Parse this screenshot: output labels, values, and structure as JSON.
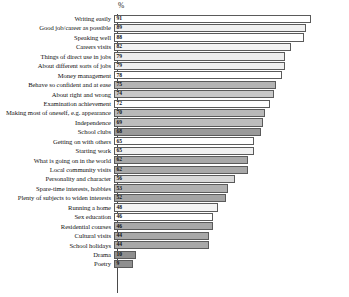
{
  "chart": {
    "axis_header": "%",
    "value_suffix": ""
  },
  "chart_data": {
    "type": "bar",
    "orientation": "horizontal",
    "title": "",
    "subtitle": "",
    "xlabel": "%",
    "ylabel": "",
    "xlim": [
      0,
      100
    ],
    "grid": false,
    "legend": "none",
    "categories": [
      "Writing easily",
      "Good job/career as possible",
      "Speaking well",
      "Careers visits",
      "Things of direct use in jobs",
      "About different sorts of jobs",
      "Money management",
      "Behave so confident and at ease",
      "About right and wrong",
      "Examination achievement",
      "Making most of oneself, e.g. appearance",
      "Independence",
      "School clubs",
      "Getting on with others",
      "Starting work",
      "What is going on in the world",
      "Local community visits",
      "Personality and character",
      "Spare-time interests, hobbies",
      "Plenty of subjects to widen interests",
      "Running a home",
      "Sex education",
      "Residential courses",
      "Cultural visits",
      "School holidays",
      "Drama",
      "Poetry"
    ],
    "values": [
      91,
      89,
      88,
      82,
      79,
      79,
      78,
      75,
      74,
      72,
      70,
      69,
      68,
      65,
      65,
      62,
      62,
      56,
      53,
      52,
      48,
      46,
      46,
      44,
      44,
      10,
      9
    ],
    "bar_colors": [
      "#ffffff",
      "#f0f0f0",
      "#ffffff",
      "#f2f2f2",
      "#ededed",
      "#efefef",
      "#ffffff",
      "#b4b4b4",
      "#c8c8c8",
      "#ffffff",
      "#b9b9b9",
      "#bdbdbd",
      "#9a9a9a",
      "#ffffff",
      "#f0f0f0",
      "#a8a8a8",
      "#a8a8a8",
      "#d8d8d8",
      "#b0b0b0",
      "#a4a4a4",
      "#f4f4f4",
      "#ffffff",
      "#a8a8a8",
      "#a8a8a8",
      "#a8a8a8",
      "#8f8f8f",
      "#8f8f8f"
    ]
  }
}
